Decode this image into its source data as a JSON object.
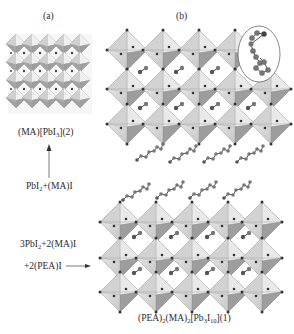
{
  "panels": {
    "a": {
      "label": "(a)",
      "compound": {
        "pre": "(MA)[PbI",
        "sub": "3",
        "post": "](2)"
      },
      "precursor": {
        "pre": "PbI",
        "sub": "2",
        "post": "+(MA)I"
      }
    },
    "b": {
      "label": "(b)",
      "precursor_line1": {
        "pre": "3PbI",
        "sub": "2",
        "post": "+2(MA)I"
      },
      "precursor_line2": "+2(PEA)I",
      "compound": {
        "p1": "(PEA)",
        "s1": "2",
        "p2": "(MA)",
        "s2": "2",
        "p3": "[Pb",
        "s3": "3",
        "p4": "I",
        "s4": "10",
        "p5": "](1)"
      },
      "inset": "PEA cation (circled)"
    }
  },
  "colors": {
    "octahedron_light": "#e6e6e6",
    "octahedron_mid": "#bdbdbd",
    "octahedron_dark": "#8f8f8f",
    "atom": "#333333",
    "organic": "#6b6b6b",
    "line": "#555555"
  }
}
